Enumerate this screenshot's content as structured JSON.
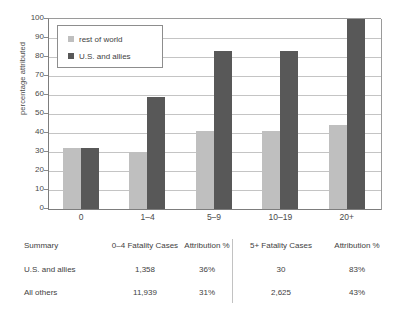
{
  "chart_data": {
    "type": "bar",
    "title": "",
    "xlabel": "",
    "ylabel": "percentage attributed",
    "ylim": [
      0,
      100
    ],
    "ytick_step": 10,
    "yticks": [
      0,
      10,
      20,
      30,
      40,
      50,
      60,
      70,
      80,
      90,
      100
    ],
    "grid": true,
    "categories": [
      "0",
      "1–4",
      "5–9",
      "10–19",
      "20+"
    ],
    "series": [
      {
        "name": "rest of world",
        "color": "#bfbfbf",
        "values": [
          32,
          30,
          41,
          41,
          44
        ]
      },
      {
        "name": "U.S. and allies",
        "color": "#585858",
        "values": [
          32,
          59,
          83,
          83,
          100
        ]
      }
    ],
    "legend": {
      "position": "top-left-inside",
      "entries": [
        {
          "label": "rest of world",
          "color": "#bfbfbf"
        },
        {
          "label": "U.S. and allies",
          "color": "#585858"
        }
      ]
    }
  },
  "summary_table": {
    "headers": [
      "Summary",
      "0–4 Fatality Cases",
      "Attribution %",
      "5+ Fatality Cases",
      "Attribution %"
    ],
    "rows": [
      {
        "label": "U.S. and allies",
        "cases_0_4": "1,358",
        "attr_0_4": "36%",
        "cases_5plus": "30",
        "attr_5plus": "83%"
      },
      {
        "label": "All others",
        "cases_0_4": "11,939",
        "attr_0_4": "31%",
        "cases_5plus": "2,625",
        "attr_5plus": "43%"
      }
    ]
  }
}
